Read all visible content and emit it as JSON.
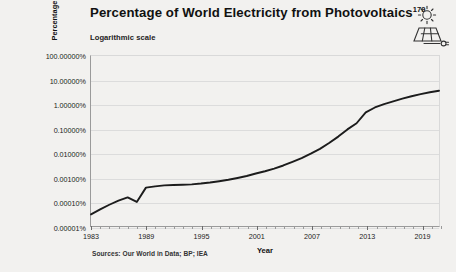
{
  "header": {
    "title": "Percentage of World Electricity from Photovoltaics",
    "title_superscript": "179",
    "subtitle": "Logarithmic scale",
    "icon": "solar-panel-sun-icon"
  },
  "footer": {
    "sources": "Sources: Our World in Data; BP; IEA"
  },
  "colors": {
    "background": "#f2f1ef",
    "line": "#1c1c1c",
    "grid": "#dcdcdc",
    "axis": "#9a9a9a",
    "text": "#1a1a1a"
  },
  "chart_data": {
    "type": "line",
    "title": "Percentage of World Electricity from Photovoltaics",
    "subtitle": "Logarithmic scale",
    "xlabel": "Year",
    "ylabel": "Percentage of world electricity generation",
    "yscale": "log",
    "ylim": [
      1e-05,
      100
    ],
    "xlim": [
      1983,
      2021
    ],
    "grid": true,
    "legend": null,
    "ytick_labels": [
      "100.00000%",
      "10.00000%",
      "1.00000%",
      "0.10000%",
      "0.01000%",
      "0.00100%",
      "0.00010%",
      "0.00001%"
    ],
    "ytick_values": [
      100,
      10,
      1,
      0.1,
      0.01,
      0.001,
      0.0001,
      1e-05
    ],
    "xtick_labels": [
      "1983",
      "1989",
      "1995",
      "2001",
      "2007",
      "2013",
      "2019"
    ],
    "xtick_values": [
      1983,
      1989,
      1995,
      2001,
      2007,
      2013,
      2019
    ],
    "xminor_step": 1,
    "series": [
      {
        "name": "Photovoltaics share of world electricity",
        "x": [
          1983,
          1984,
          1985,
          1986,
          1987,
          1988,
          1989,
          1990,
          1991,
          1992,
          1993,
          1994,
          1995,
          1996,
          1997,
          1998,
          1999,
          2000,
          2001,
          2002,
          2003,
          2004,
          2005,
          2006,
          2007,
          2008,
          2009,
          2010,
          2011,
          2012,
          2013,
          2014,
          2015,
          2016,
          2017,
          2018,
          2019,
          2020,
          2021
        ],
        "y": [
          3e-05,
          4.8e-05,
          7.5e-05,
          0.00011,
          0.00015,
          9.8e-05,
          0.00038,
          0.00043,
          0.00047,
          0.00049,
          0.0005,
          0.00052,
          0.00056,
          0.00062,
          0.0007,
          0.0008,
          0.00095,
          0.00115,
          0.00145,
          0.0018,
          0.0023,
          0.0031,
          0.0044,
          0.0063,
          0.0095,
          0.015,
          0.026,
          0.048,
          0.095,
          0.17,
          0.48,
          0.76,
          1.05,
          1.35,
          1.75,
          2.2,
          2.7,
          3.2,
          3.7
        ]
      }
    ]
  }
}
